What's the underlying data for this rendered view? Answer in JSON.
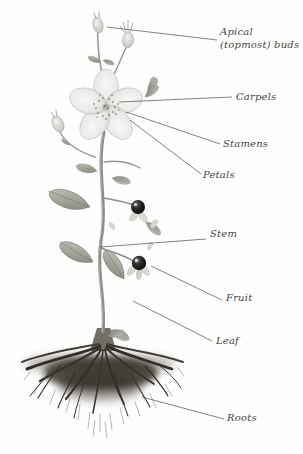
{
  "figure": {
    "type": "labeled-botanical-diagram",
    "labels": {
      "apical_buds": "Apical (topmost) buds",
      "carpels": "Carpels",
      "stamens": "Stamens",
      "petals": "Petals",
      "stem": "Stem",
      "fruit": "Fruit",
      "leaf": "Leaf",
      "roots": "Roots"
    },
    "colors": {
      "background": "#fefefe",
      "label_text": "#45453e",
      "leader_line": "#52524a",
      "petal": "#e9e9e7",
      "foliage": "#9a9a91",
      "fruit": "#0d0d0d",
      "roots": "#2c2620"
    }
  }
}
